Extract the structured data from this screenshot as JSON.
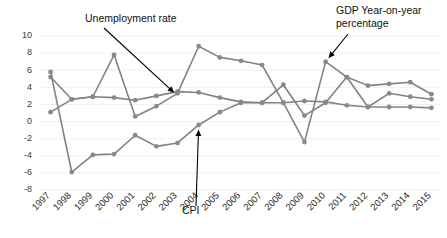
{
  "chart_data": {
    "type": "line",
    "title": "",
    "xlabel": "",
    "ylabel": "",
    "grid": true,
    "legend_position": "annotations-inline",
    "ylim": [
      -8,
      10
    ],
    "ytick_step": 2,
    "yticks": [
      "10",
      "8",
      "6",
      "4",
      "2",
      "0",
      "-2",
      "-4",
      "-6",
      "-8"
    ],
    "categories": [
      "1997",
      "1998",
      "1999",
      "2000",
      "2001",
      "2002",
      "2003",
      "2004",
      "2005",
      "2006",
      "2007",
      "2008",
      "2009",
      "2010",
      "2011",
      "2012",
      "2013",
      "2014",
      "2015"
    ],
    "series": [
      {
        "name": "Unemployment rate",
        "color": "#87898c",
        "values": [
          1.1,
          2.6,
          2.9,
          2.8,
          2.5,
          3.0,
          3.5,
          3.4,
          2.8,
          2.3,
          2.2,
          2.2,
          2.4,
          2.3,
          1.9,
          1.7,
          1.7,
          1.7,
          1.6
        ]
      },
      {
        "name": "GDP Year-on-year percentage",
        "color": "#87898c",
        "values": [
          5.2,
          2.6,
          2.9,
          7.8,
          0.6,
          1.8,
          3.3,
          8.8,
          7.5,
          7.1,
          6.6,
          2.2,
          -2.4,
          7.0,
          5.2,
          4.2,
          4.4,
          4.6,
          3.2
        ]
      },
      {
        "name": "CPI",
        "color": "#87898c",
        "values": [
          5.8,
          -5.9,
          -3.9,
          -3.8,
          -1.6,
          -2.9,
          -2.5,
          -0.4,
          1.1,
          2.2,
          2.2,
          4.3,
          0.7,
          2.2,
          5.2,
          1.7,
          3.3,
          2.9,
          2.6
        ]
      }
    ],
    "annotations": [
      {
        "id": "unemployment",
        "label_line1": "Unemployment rate",
        "label_line2": "",
        "target_year": "2003",
        "target_value": 3.0
      },
      {
        "id": "gdp",
        "label_line1": "GDP Year-on-year",
        "label_line2": "percentage",
        "target_year": "2010",
        "target_value": 7.0
      },
      {
        "id": "cpi",
        "label_line1": "CPI",
        "label_line2": "",
        "target_year": "2004",
        "target_value": -0.4
      }
    ]
  }
}
